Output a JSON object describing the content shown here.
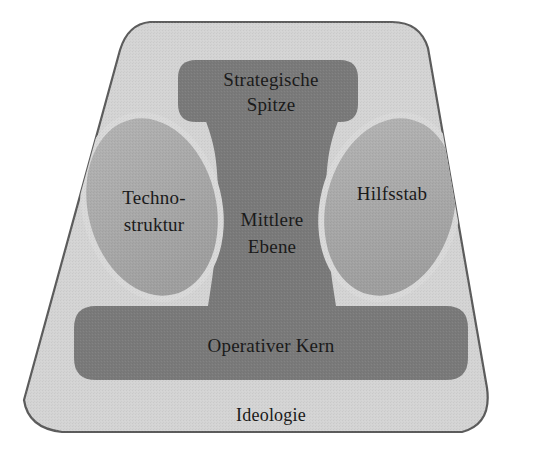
{
  "diagram": {
    "type": "organizational-structure-diagram",
    "language": "de",
    "background_color": "#ffffff",
    "outer_shell": {
      "name": "Ideologie",
      "label": "Ideologie",
      "fill_color": "#d4d4d4",
      "stroke_color": "#595959",
      "shape": "rounded-trapezoid"
    },
    "parts": [
      {
        "id": "strategic-apex",
        "label": "Strategische Spitze",
        "label_lines": [
          "Strategische",
          "Spitze"
        ],
        "fill_color": "#7a7a7a",
        "shape": "rounded-bar-top",
        "position": "top-center"
      },
      {
        "id": "technostructure",
        "label": "Techno-struktur",
        "label_lines": [
          "Techno-",
          "struktur"
        ],
        "fill_color": "#a9a9a9",
        "shape": "tilted-ellipse",
        "position": "middle-left"
      },
      {
        "id": "middle-line",
        "label": "Mittlere Ebene",
        "label_lines": [
          "Mittlere",
          "Ebene"
        ],
        "fill_color": "#7a7a7a",
        "shape": "waisted-column",
        "position": "center"
      },
      {
        "id": "support-staff",
        "label": "Hilfsstab",
        "label_lines": [
          "Hilfsstab"
        ],
        "fill_color": "#a9a9a9",
        "shape": "tilted-ellipse",
        "position": "middle-right"
      },
      {
        "id": "operating-core",
        "label": "Operativer Kern",
        "label_lines": [
          "Operativer Kern"
        ],
        "fill_color": "#7a7a7a",
        "shape": "rounded-bar-bottom",
        "position": "bottom-center"
      }
    ],
    "labels": {
      "strategic_apex_line1": "Strategische",
      "strategic_apex_line2": "Spitze",
      "technostructure_line1": "Techno-",
      "technostructure_line2": "struktur",
      "middle_line_line1": "Mittlere",
      "middle_line_line2": "Ebene",
      "support_staff_line1": "Hilfsstab",
      "operating_core_line1": "Operativer Kern",
      "ideology_line1": "Ideologie"
    }
  }
}
